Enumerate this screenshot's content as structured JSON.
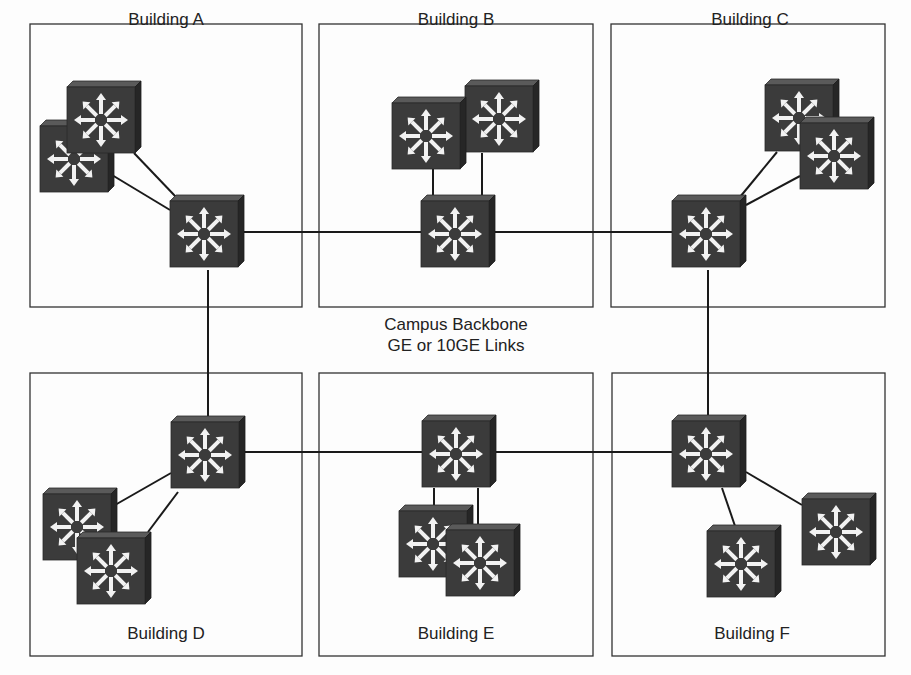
{
  "diagram": {
    "title": "Campus Backbone",
    "backbone_label": {
      "line1": "Campus Backbone",
      "line2": "GE or 10GE Links"
    },
    "colors": {
      "box_border": "#333333",
      "link": "#1a1a1a",
      "switch_face": "#3a3a3a",
      "switch_top": "#555555",
      "switch_side": "#2a2a2a",
      "switch_arrow": "#f2f2f2"
    },
    "buildings": [
      {
        "id": "A",
        "label": "Building A",
        "box": [
          30,
          24,
          272,
          283
        ],
        "label_pos": [
          166,
          42
        ]
      },
      {
        "id": "B",
        "label": "Building B",
        "box": [
          319,
          24,
          274,
          283
        ],
        "label_pos": [
          456,
          42
        ]
      },
      {
        "id": "C",
        "label": "Building C",
        "box": [
          611,
          24,
          274,
          283
        ],
        "label_pos": [
          752,
          42
        ]
      },
      {
        "id": "D",
        "label": "Building D",
        "box": [
          30,
          373,
          272,
          283
        ],
        "label_pos": [
          166,
          633
        ]
      },
      {
        "id": "E",
        "label": "Building E",
        "box": [
          319,
          373,
          274,
          283
        ],
        "label_pos": [
          456,
          633
        ]
      },
      {
        "id": "F",
        "label": "Building F",
        "box": [
          612,
          373,
          273,
          283
        ],
        "label_pos": [
          752,
          633
        ]
      }
    ],
    "switches": [
      {
        "id": "A-core",
        "building": "A",
        "role": "distribution",
        "x": 170,
        "y": 196
      },
      {
        "id": "A-acc1",
        "building": "A",
        "role": "access",
        "x": 40,
        "y": 120
      },
      {
        "id": "A-acc2",
        "building": "A",
        "role": "access",
        "x": 67,
        "y": 81
      },
      {
        "id": "B-core",
        "building": "B",
        "role": "distribution",
        "x": 421,
        "y": 195
      },
      {
        "id": "B-acc1",
        "building": "B",
        "role": "access",
        "x": 392,
        "y": 97
      },
      {
        "id": "B-acc2",
        "building": "B",
        "role": "access",
        "x": 465,
        "y": 80
      },
      {
        "id": "C-core",
        "building": "C",
        "role": "distribution",
        "x": 672,
        "y": 195
      },
      {
        "id": "C-acc1",
        "building": "C",
        "role": "access",
        "x": 765,
        "y": 79
      },
      {
        "id": "C-acc2",
        "building": "C",
        "role": "access",
        "x": 800,
        "y": 117
      },
      {
        "id": "D-core",
        "building": "D",
        "role": "distribution",
        "x": 171,
        "y": 416
      },
      {
        "id": "D-acc1",
        "building": "D",
        "role": "access",
        "x": 43,
        "y": 488
      },
      {
        "id": "D-acc2",
        "building": "D",
        "role": "access",
        "x": 77,
        "y": 532
      },
      {
        "id": "E-core",
        "building": "E",
        "role": "distribution",
        "x": 422,
        "y": 415
      },
      {
        "id": "E-acc1",
        "building": "E",
        "role": "access",
        "x": 399,
        "y": 505
      },
      {
        "id": "E-acc2",
        "building": "E",
        "role": "access",
        "x": 446,
        "y": 524
      },
      {
        "id": "F-core",
        "building": "F",
        "role": "distribution",
        "x": 672,
        "y": 415
      },
      {
        "id": "F-acc1",
        "building": "F",
        "role": "access",
        "x": 707,
        "y": 525
      },
      {
        "id": "F-acc2",
        "building": "F",
        "role": "access",
        "x": 802,
        "y": 493
      }
    ],
    "links": [
      {
        "from": "A-core",
        "to": "B-core",
        "type": "backbone",
        "pts": [
          [
            244,
            232
          ],
          [
            421,
            232
          ]
        ]
      },
      {
        "from": "B-core",
        "to": "C-core",
        "type": "backbone",
        "pts": [
          [
            495,
            232
          ],
          [
            672,
            232
          ]
        ]
      },
      {
        "from": "A-core",
        "to": "D-core",
        "type": "backbone",
        "pts": [
          [
            208,
            270
          ],
          [
            208,
            416
          ]
        ]
      },
      {
        "from": "C-core",
        "to": "F-core",
        "type": "backbone",
        "pts": [
          [
            708,
            270
          ],
          [
            708,
            415
          ]
        ]
      },
      {
        "from": "D-core",
        "to": "E-core",
        "type": "backbone",
        "pts": [
          [
            245,
            452
          ],
          [
            422,
            452
          ]
        ]
      },
      {
        "from": "E-core",
        "to": "F-core",
        "type": "backbone",
        "pts": [
          [
            496,
            452
          ],
          [
            672,
            452
          ]
        ]
      },
      {
        "from": "A-acc2",
        "to": "A-core",
        "type": "access",
        "pts": [
          [
            134,
            153
          ],
          [
            176,
            197
          ]
        ]
      },
      {
        "from": "A-acc1",
        "to": "A-core",
        "type": "access",
        "pts": [
          [
            112,
            175
          ],
          [
            170,
            210
          ]
        ]
      },
      {
        "from": "B-acc1",
        "to": "B-core",
        "type": "access",
        "pts": [
          [
            433,
            168
          ],
          [
            433,
            195
          ]
        ]
      },
      {
        "from": "B-acc2",
        "to": "B-core",
        "type": "access",
        "pts": [
          [
            482,
            153
          ],
          [
            482,
            195
          ]
        ]
      },
      {
        "from": "C-acc1",
        "to": "C-core",
        "type": "access",
        "pts": [
          [
            777,
            152
          ],
          [
            740,
            196
          ]
        ]
      },
      {
        "from": "C-acc2",
        "to": "C-core",
        "type": "access",
        "pts": [
          [
            800,
            176
          ],
          [
            746,
            205
          ]
        ]
      },
      {
        "from": "D-acc1",
        "to": "D-core",
        "type": "access",
        "pts": [
          [
            115,
            505
          ],
          [
            171,
            473
          ]
        ]
      },
      {
        "from": "D-acc2",
        "to": "D-core",
        "type": "access",
        "pts": [
          [
            148,
            530
          ],
          [
            178,
            492
          ]
        ]
      },
      {
        "from": "E-acc1",
        "to": "E-core",
        "type": "access",
        "pts": [
          [
            434,
            489
          ],
          [
            434,
            506
          ]
        ]
      },
      {
        "from": "E-acc2",
        "to": "E-core",
        "type": "access",
        "pts": [
          [
            478,
            489
          ],
          [
            478,
            524
          ]
        ]
      },
      {
        "from": "F-acc1",
        "to": "F-core",
        "type": "access",
        "pts": [
          [
            722,
            489
          ],
          [
            735,
            525
          ]
        ]
      },
      {
        "from": "F-acc2",
        "to": "F-core",
        "type": "access",
        "pts": [
          [
            746,
            473
          ],
          [
            802,
            505
          ]
        ]
      }
    ]
  }
}
